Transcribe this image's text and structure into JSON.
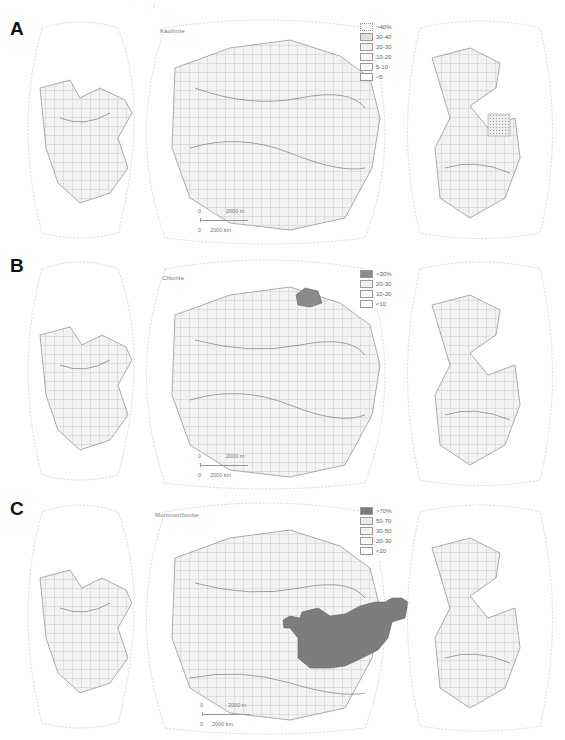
{
  "figure": {
    "top_marks": [
      "·",
      "|"
    ],
    "panels": [
      {
        "letter": "A",
        "mineral": "Kaolinite",
        "legend": [
          {
            "label": ">40%",
            "fill": "#ffffff",
            "pattern": "dots-dense"
          },
          {
            "label": "30-40",
            "fill": "#e4e4e4",
            "pattern": "cross"
          },
          {
            "label": "20-30",
            "fill": "#f3f3f3",
            "pattern": "dots"
          },
          {
            "label": "10-20",
            "fill": "#f7f7f7",
            "pattern": "lines"
          },
          {
            "label": "5-10",
            "fill": "#fafafa",
            "pattern": "sparse"
          },
          {
            "label": "<5",
            "fill": "#ffffff",
            "pattern": "none"
          }
        ],
        "scale": {
          "top_label": "2000 m",
          "bottom_label": "2000 km",
          "zero_top": "0",
          "zero_bottom": "0"
        },
        "contour_labels": [
          "10",
          "20",
          "30",
          "40",
          "5",
          "10",
          "20",
          "10",
          "20",
          "30"
        ],
        "graticule_labels": {
          "left": [
            "80°",
            "60°",
            "40°",
            "20°",
            "0°",
            "20°",
            "40°",
            "60°",
            "80°"
          ],
          "center": [
            "80°",
            "80°",
            "60°",
            "60°",
            "40°",
            "20°",
            "0°",
            "180 W",
            "160°",
            "140°",
            "120°",
            "100°",
            "20°",
            "40°",
            "60°"
          ],
          "right": [
            "80°",
            "80°",
            "60°",
            "60°",
            "40°",
            "20°",
            "0°",
            "W 20 E",
            "20°",
            "40°",
            "60°",
            "80°"
          ]
        }
      },
      {
        "letter": "B",
        "mineral": "Chlorite",
        "legend": [
          {
            "label": ">30%",
            "fill": "#8a8a8a",
            "pattern": "solid"
          },
          {
            "label": "20-30",
            "fill": "#f1f1f1",
            "pattern": "dots"
          },
          {
            "label": "10-20",
            "fill": "#f7f7f7",
            "pattern": "lines"
          },
          {
            "label": "<10",
            "fill": "#ffffff",
            "pattern": "none"
          }
        ],
        "scale": {
          "top_label": "2000 m",
          "bottom_label": "2000 km",
          "zero_top": "0",
          "zero_bottom": "0"
        },
        "contour_labels": [
          "10",
          "20",
          "10",
          "20",
          "10",
          "10",
          "20",
          "10",
          "20",
          "10"
        ],
        "graticule_labels": {
          "left": [
            "80°",
            "60°",
            "40°",
            "20°",
            "0°",
            "20°",
            "40°",
            "60°",
            "80°"
          ],
          "center": [
            "80°",
            "80°",
            "60°",
            "60°",
            "40°",
            "20°",
            "0°",
            "180 W",
            "160°",
            "140°",
            "120°",
            "100°",
            "40°",
            "60°"
          ],
          "right": [
            "80°",
            "80°",
            "60°",
            "60°",
            "40°",
            "20°",
            "0°",
            "W 20 E",
            "20°",
            "40°",
            "60°",
            "80°"
          ]
        }
      },
      {
        "letter": "C",
        "mineral": "Montmorillonite",
        "legend": [
          {
            "label": ">70%",
            "fill": "#7a7a7a",
            "pattern": "solid"
          },
          {
            "label": "50-70",
            "fill": "#ececec",
            "pattern": "dots"
          },
          {
            "label": "30-50",
            "fill": "#f3f3f3",
            "pattern": "lines"
          },
          {
            "label": "20-30",
            "fill": "#f8f8f8",
            "pattern": "sparse"
          },
          {
            "label": "<20",
            "fill": "#ffffff",
            "pattern": "none"
          }
        ],
        "scale": {
          "top_label": "2000 m",
          "bottom_label": "2000 km",
          "zero_top": "0",
          "zero_bottom": "0"
        },
        "contour_labels": [
          "30",
          "50",
          "70",
          "50",
          "30",
          "20",
          "50",
          "70",
          "30",
          "20"
        ],
        "graticule_labels": {
          "left": [
            "80°",
            "60°",
            "40°",
            "20°",
            "0°",
            "20°",
            "40°",
            "60°",
            "80°"
          ],
          "center": [
            "80°",
            "80°",
            "60°",
            "60°",
            "40°",
            "20°",
            "0°",
            "180 W",
            "160°",
            "140°",
            "120°",
            "100°",
            "20°",
            "40°",
            "60°",
            "80°"
          ],
          "right": [
            "80°",
            "80°",
            "60°",
            "60°",
            "40°",
            "20°",
            "0°",
            "W 20 E",
            "20°",
            "40°",
            "60°",
            "80°"
          ]
        }
      }
    ],
    "colors": {
      "land": "#ffffff",
      "ocean_base": "#f4f4f4",
      "graticule": "#9a9a9a",
      "coast": "#777777",
      "contour": "#666666",
      "high_value_fill": "#7d7d7d"
    }
  }
}
